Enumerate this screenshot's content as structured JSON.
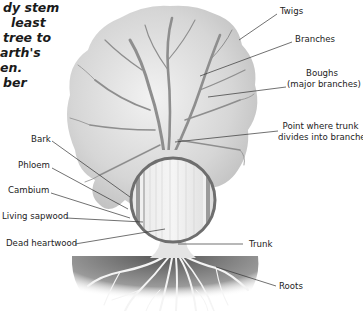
{
  "intro_text": {
    "lines": [
      "dy stem",
      "least",
      "tree to",
      "arth's",
      "en.",
      "ber"
    ],
    "offsets": [
      35,
      44,
      31,
      26,
      20,
      30
    ]
  },
  "labels": {
    "twigs": "Twigs",
    "branches": "Branches",
    "boughs_line1": "Boughs",
    "boughs_line2": "(major branches)",
    "point_line1": "Point where trunk",
    "point_line2": "divides into branches",
    "bark": "Bark",
    "phloem": "Phloem",
    "cambium": "Cambium",
    "living_sapwood": "Living sapwood",
    "dead_heartwood": "Dead heartwood",
    "trunk": "Trunk",
    "roots": "Roots"
  },
  "colors": {
    "canopy": "#d4d4d4",
    "branch": "#8a8a8a",
    "circle_rim": "#6e6e6e",
    "soil_dark": "#5a5a5a",
    "leader": "#333333",
    "text": "#222222"
  }
}
